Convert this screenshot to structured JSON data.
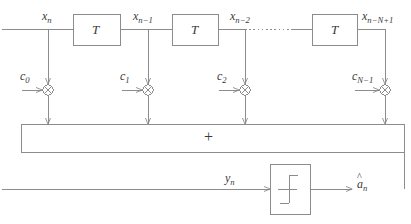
{
  "figure": {
    "type": "block-diagram",
    "line_color": "#8c8c8c",
    "text_color": "#3a3a3a",
    "background": "#ffffff"
  },
  "signals": {
    "tap0": {
      "base": "x",
      "sub": "n"
    },
    "tap1": {
      "base": "x",
      "sub": "n−1"
    },
    "tap2": {
      "base": "x",
      "sub": "n−2"
    },
    "tap3": {
      "base": "x",
      "sub": "n−N+1"
    },
    "sum_out": {
      "base": "y",
      "sub": "n"
    },
    "decision_out": {
      "base": "a",
      "sub": "n",
      "accent": "̂"
    }
  },
  "coefficients": [
    {
      "base": "c",
      "sub": "0"
    },
    {
      "base": "c",
      "sub": "1"
    },
    {
      "base": "c",
      "sub": "2"
    },
    {
      "base": "c",
      "sub": "N−1"
    }
  ],
  "delay_blocks": [
    {
      "label": "T"
    },
    {
      "label": "T"
    },
    {
      "label": "T"
    }
  ],
  "adder": {
    "label": "+"
  },
  "decision_device": {
    "label": "step-function",
    "symbol": "∫"
  },
  "multipliers": [
    {
      "symbol": "⊗"
    },
    {
      "symbol": "⊗"
    },
    {
      "symbol": "⊗"
    },
    {
      "symbol": "⊗"
    }
  ],
  "dotted_continuation": {
    "label": ""
  }
}
